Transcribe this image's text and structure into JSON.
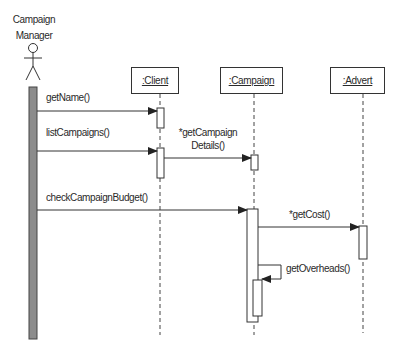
{
  "diagram": {
    "type": "UML sequence diagram",
    "actor": {
      "name_line1": "Campaign",
      "name_line2": "Manager"
    },
    "objects": [
      {
        "label": ":Client"
      },
      {
        "label": ":Campaign"
      },
      {
        "label": ":Advert"
      }
    ],
    "messages": [
      {
        "label": "getName()",
        "from": "Campaign Manager",
        "to": ":Client"
      },
      {
        "label": "listCampaigns()",
        "from": "Campaign Manager",
        "to": ":Client"
      },
      {
        "label_line1": "*getCampaign",
        "label_line2": "Details()",
        "from": ":Client",
        "to": ":Campaign"
      },
      {
        "label": "checkCampaignBudget()",
        "from": "Campaign Manager",
        "to": ":Campaign"
      },
      {
        "label": "*getCost()",
        "from": ":Campaign",
        "to": ":Advert"
      },
      {
        "label": "getOverheads()",
        "from": ":Campaign",
        "to": ":Campaign"
      }
    ],
    "colors": {
      "line": "#333333",
      "actor_activation_fill": "#8c8c8c",
      "background": "#ffffff"
    }
  }
}
